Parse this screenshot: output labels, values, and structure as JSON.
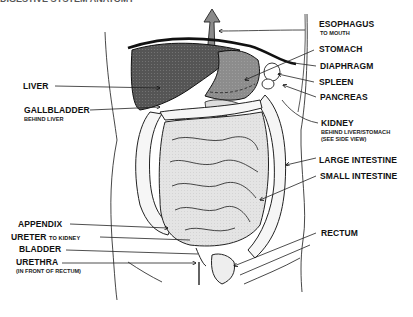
{
  "title_partial": "DIGESTIVE SYSTEM ANATOMY",
  "colors": {
    "ink": "#111111",
    "liver": "#4a4a4a",
    "stomach": "#8a8a8a",
    "intestine_fill": "#e6e6e6",
    "background": "#ffffff"
  },
  "labels_left": [
    {
      "id": "liver",
      "text": "LIVER",
      "sub": ""
    },
    {
      "id": "gallbladder",
      "text": "GALLBLADDER",
      "sub": "BEHIND LIVER"
    },
    {
      "id": "appendix",
      "text": "APPENDIX",
      "sub": ""
    },
    {
      "id": "ureter",
      "text": "URETER",
      "sub": "TO KIDNEY"
    },
    {
      "id": "bladder",
      "text": "BLADDER",
      "sub": ""
    },
    {
      "id": "urethra",
      "text": "URETHRA",
      "sub": "(IN FRONT OF RECTUM)"
    }
  ],
  "labels_right": [
    {
      "id": "esophagus",
      "text": "ESOPHAGUS",
      "sub": "TO MOUTH"
    },
    {
      "id": "stomach",
      "text": "STOMACH",
      "sub": ""
    },
    {
      "id": "diaphragm",
      "text": "DIAPHRAGM",
      "sub": ""
    },
    {
      "id": "spleen",
      "text": "SPLEEN",
      "sub": ""
    },
    {
      "id": "pancreas",
      "text": "PANCREAS",
      "sub": ""
    },
    {
      "id": "kidney",
      "text": "KIDNEY",
      "sub": "BEHIND LIVER/STOMACH",
      "sub2": "(SEE SIDE VIEW)"
    },
    {
      "id": "large_intestine",
      "text": "LARGE INTESTINE",
      "sub": ""
    },
    {
      "id": "small_intestine",
      "text": "SMALL INTESTINE",
      "sub": ""
    },
    {
      "id": "rectum",
      "text": "RECTUM",
      "sub": ""
    }
  ]
}
